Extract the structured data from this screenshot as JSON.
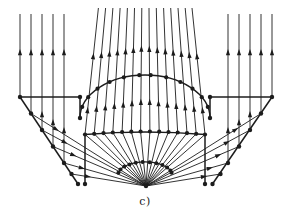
{
  "figure": {
    "caption": "c)",
    "background": "#ffffff",
    "ink": "#1c1c1c"
  },
  "diagram": {
    "width": 290,
    "height": 221,
    "paths": [
      {
        "d": "M80,118 A65,43 0 0 1 210,118",
        "w": 1.4
      },
      {
        "d": "M118.4,172.7 A27,13 0 0 1 171.6,172.7",
        "w": 1.3
      },
      {
        "d": "M85,134.5 Q145,129.5 205,134.5",
        "w": 1.4
      }
    ],
    "struct_lines": [
      [
        20,
        97,
        80,
        97
      ],
      [
        210,
        97,
        272,
        97
      ],
      [
        80,
        97,
        80,
        118
      ],
      [
        210,
        97,
        210,
        118
      ],
      [
        20,
        97,
        78,
        184
      ],
      [
        272,
        97,
        212.5,
        184
      ],
      [
        85,
        134.5,
        85,
        184
      ],
      [
        205,
        134.5,
        205,
        184
      ]
    ],
    "flow_lines": [
      [
        20,
        14,
        20,
        97
      ],
      [
        31,
        14,
        31,
        113.5
      ],
      [
        42,
        14,
        42,
        130
      ],
      [
        53,
        14,
        53,
        146.5
      ],
      [
        64,
        14,
        64,
        163
      ],
      [
        272,
        14,
        272,
        97
      ],
      [
        261,
        14,
        261,
        113.5
      ],
      [
        250,
        14,
        250,
        130
      ],
      [
        239,
        14,
        239,
        146.5
      ],
      [
        228,
        14,
        228,
        163
      ],
      [
        85,
        134.5,
        98.4,
        8
      ],
      [
        94.2,
        133.8,
        105.6,
        8
      ],
      [
        103.5,
        133.1,
        112.9,
        8
      ],
      [
        112.8,
        132.5,
        120.1,
        8
      ],
      [
        122.1,
        132,
        127.4,
        8
      ],
      [
        131.3,
        131.7,
        134.5,
        8
      ],
      [
        140.6,
        131.5,
        141.8,
        8
      ],
      [
        149.9,
        131.5,
        149,
        8
      ],
      [
        159.2,
        131.7,
        156.3,
        8
      ],
      [
        168.5,
        132,
        163.6,
        8
      ],
      [
        177.7,
        132.5,
        170.7,
        8
      ],
      [
        187,
        133.1,
        178,
        8
      ],
      [
        196.2,
        133.8,
        185.2,
        8
      ],
      [
        205,
        134.5,
        192,
        8
      ],
      [
        146,
        186,
        85,
        134.5
      ],
      [
        146,
        186,
        94.2,
        133.8
      ],
      [
        146,
        186,
        103.5,
        133.1
      ],
      [
        146,
        186,
        112.8,
        132.5
      ],
      [
        146,
        186,
        122.1,
        132
      ],
      [
        146,
        186,
        131.3,
        131.7
      ],
      [
        146,
        186,
        140.6,
        131.5
      ],
      [
        146,
        186,
        149.9,
        131.5
      ],
      [
        146,
        186,
        159.2,
        131.7
      ],
      [
        146,
        186,
        168.5,
        132
      ],
      [
        146,
        186,
        177.7,
        132.5
      ],
      [
        146,
        186,
        187,
        133.1
      ],
      [
        146,
        186,
        196.2,
        133.8
      ],
      [
        146,
        186,
        205,
        134.5
      ],
      [
        146,
        186,
        31,
        113.5
      ],
      [
        146,
        186,
        42,
        130
      ],
      [
        146,
        186,
        53,
        146.5
      ],
      [
        146,
        186,
        64,
        163
      ],
      [
        146,
        186,
        71.5,
        174
      ],
      [
        146,
        186,
        261,
        113.5
      ],
      [
        146,
        186,
        250,
        130
      ],
      [
        146,
        186,
        239,
        146.5
      ],
      [
        146,
        186,
        228,
        163
      ],
      [
        146,
        186,
        220.5,
        174
      ]
    ],
    "dots": [
      [
        20,
        97,
        2.2
      ],
      [
        80,
        97,
        2.2
      ],
      [
        210,
        97,
        2.2
      ],
      [
        272,
        97,
        2.2
      ],
      [
        80,
        118,
        2.2
      ],
      [
        210,
        118,
        2.2
      ],
      [
        31,
        113.5,
        2.2
      ],
      [
        42,
        130,
        2.2
      ],
      [
        53,
        146.5,
        2.2
      ],
      [
        64,
        163,
        2.2
      ],
      [
        71.5,
        174,
        2.2
      ],
      [
        78,
        184,
        2.2
      ],
      [
        261,
        113.5,
        2.2
      ],
      [
        250,
        130,
        2.2
      ],
      [
        239,
        146.5,
        2.2
      ],
      [
        228,
        163,
        2.2
      ],
      [
        220.5,
        174,
        2.2
      ],
      [
        212.5,
        184,
        2.2
      ],
      [
        85,
        184,
        2.2
      ],
      [
        205,
        184,
        2.2
      ],
      [
        85,
        134.5,
        2.1
      ],
      [
        94.2,
        133.8,
        2.1
      ],
      [
        103.5,
        133.1,
        2.1
      ],
      [
        112.8,
        132.5,
        2.1
      ],
      [
        122.1,
        132,
        2.1
      ],
      [
        131.3,
        131.7,
        2.1
      ],
      [
        140.6,
        131.5,
        2.1
      ],
      [
        149.9,
        131.5,
        2.1
      ],
      [
        159.2,
        131.7,
        2.1
      ],
      [
        168.5,
        132,
        2.1
      ],
      [
        177.7,
        132.5,
        2.1
      ],
      [
        187,
        133.1,
        2.1
      ],
      [
        196.2,
        133.8,
        2.1
      ],
      [
        205,
        134.5,
        2.1
      ],
      [
        82.2,
        106.9,
        2.1
      ],
      [
        88.2,
        97.2,
        2.1
      ],
      [
        97.5,
        88.7,
        2.1
      ],
      [
        109.6,
        82,
        2.1
      ],
      [
        123.8,
        77.3,
        2.1
      ],
      [
        139.3,
        75.2,
        2.1
      ],
      [
        150.7,
        75.2,
        2.1
      ],
      [
        166.2,
        77.3,
        2.1
      ],
      [
        180.4,
        82,
        2.1
      ],
      [
        192.5,
        88.7,
        2.1
      ],
      [
        201.8,
        97.2,
        2.1
      ],
      [
        207.8,
        106.9,
        2.1
      ],
      [
        118.4,
        172.7,
        2
      ],
      [
        120.5,
        169.5,
        2
      ],
      [
        124.3,
        166.6,
        2
      ],
      [
        129.5,
        164.4,
        2
      ],
      [
        135.8,
        162.8,
        2
      ],
      [
        142.6,
        162.1,
        2
      ],
      [
        149.7,
        162.2,
        2
      ],
      [
        156.4,
        163.2,
        2
      ],
      [
        162.4,
        165,
        2
      ],
      [
        167.1,
        167.5,
        2
      ],
      [
        170.4,
        170.6,
        2
      ],
      [
        171.6,
        172.7,
        2
      ],
      [
        146,
        186,
        2.2
      ]
    ],
    "arrows": [
      [
        93.3,
        56,
        -84
      ],
      [
        101.4,
        54.8,
        -84.8
      ],
      [
        109.5,
        53.5,
        -85.7
      ],
      [
        117.5,
        52.3,
        -86.6
      ],
      [
        125.6,
        51.1,
        -87.6
      ],
      [
        133.4,
        49.8,
        -88.5
      ],
      [
        141.4,
        48.6,
        -89.4
      ],
      [
        149.3,
        48.7,
        -90.4
      ],
      [
        157.3,
        49.9,
        -91.3
      ],
      [
        165.3,
        51.1,
        -92.3
      ],
      [
        173.2,
        52.4,
        -93.2
      ],
      [
        181.3,
        53.6,
        -94.1
      ],
      [
        189.3,
        54.8,
        -95
      ],
      [
        196.9,
        56,
        -95.9
      ],
      [
        87.6,
        110,
        -84
      ],
      [
        96.5,
        108.6,
        -84.8
      ],
      [
        105.4,
        107.2,
        -85.7
      ],
      [
        114.4,
        105.8,
        -86.6
      ],
      [
        123.3,
        104.4,
        -87.6
      ],
      [
        132,
        103,
        -88.5
      ],
      [
        140.9,
        101.7,
        -89.4
      ],
      [
        149.7,
        101.7,
        -90.4
      ],
      [
        158.5,
        103,
        -91.3
      ],
      [
        167.4,
        104.4,
        -92.3
      ],
      [
        176.2,
        105.8,
        -93.2
      ],
      [
        185.1,
        107.2,
        -94.1
      ],
      [
        194,
        108.6,
        -95
      ],
      [
        202.5,
        110,
        -95.9
      ],
      [
        20,
        52,
        -90
      ],
      [
        31,
        52,
        -90
      ],
      [
        42,
        52,
        -90
      ],
      [
        53,
        52,
        -90
      ],
      [
        64,
        52,
        -90
      ],
      [
        228,
        52,
        -90
      ],
      [
        239,
        52,
        -90
      ],
      [
        250,
        52,
        -90
      ],
      [
        261,
        52,
        -90
      ],
      [
        272,
        52,
        -90
      ],
      [
        42,
        114,
        -90
      ],
      [
        53,
        122,
        -90
      ],
      [
        64,
        130,
        -90
      ],
      [
        250,
        114,
        -90
      ],
      [
        239,
        122,
        -90
      ],
      [
        228,
        130,
        -90
      ],
      [
        56.3,
        129.5,
        32.2
      ],
      [
        64.9,
        142.3,
        28.3
      ],
      [
        73.5,
        155.2,
        23
      ],
      [
        82,
        168.1,
        15.7
      ],
      [
        87.9,
        176.6,
        9.2
      ],
      [
        235.7,
        129.5,
        -32.2
      ],
      [
        227.1,
        142.3,
        -28.3
      ],
      [
        218.5,
        155.2,
        -23
      ],
      [
        210,
        168.1,
        -15.7
      ],
      [
        204.1,
        176.6,
        -9.2
      ]
    ]
  }
}
